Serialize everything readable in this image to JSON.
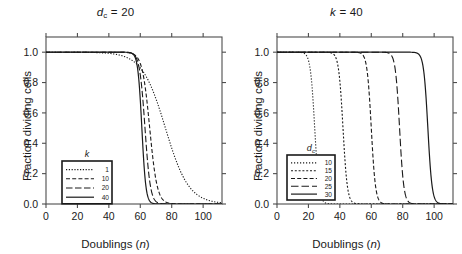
{
  "figure": {
    "background": "#ffffff",
    "line_color": "#1a1a1a",
    "axis_color": "#4d4d4d"
  },
  "chart_data": [
    {
      "type": "line",
      "panel_id": "left",
      "title": "d_c = 20",
      "title_parts": {
        "symbol": "d",
        "subscript": "c",
        "equals": "= 20"
      },
      "xlabel": "Doublings (n)",
      "xlabel_parts": {
        "text": "Doublings (",
        "italic": "n",
        "close": ")"
      },
      "ylabel": "Fraction dividing cells",
      "xlim": [
        0,
        112
      ],
      "ylim": [
        0,
        1.1
      ],
      "xticks": [
        0,
        20,
        40,
        60,
        80,
        100
      ],
      "xticklabels": [
        "0",
        "20",
        "40",
        "60",
        "80",
        "100"
      ],
      "yticks": [
        0.0,
        0.2,
        0.4,
        0.6,
        0.8,
        1.0
      ],
      "yticklabels": [
        "0.0",
        "0.2",
        "0.4",
        "0.6",
        "0.8",
        "1.0"
      ],
      "grid": false,
      "legend_position": "lower-left",
      "legend_title": "k",
      "legend_title_italic": true,
      "fixed_param": {
        "name": "d_c",
        "value": 20
      },
      "series": [
        {
          "name": "1",
          "param": "k",
          "value": 1,
          "dash": "1.2,1.6",
          "width": 1.1,
          "midpoint": 76,
          "steepness": 0.135
        },
        {
          "name": "10",
          "param": "k",
          "value": 10,
          "dash": "4,2.2",
          "width": 1.1,
          "midpoint": 66,
          "steepness": 0.42
        },
        {
          "name": "20",
          "param": "k",
          "value": 20,
          "dash": "6.5,2.5",
          "width": 1.1,
          "midpoint": 63,
          "steepness": 0.58
        },
        {
          "name": "40",
          "param": "k",
          "value": 40,
          "dash": "none",
          "width": 1.2,
          "midpoint": 61,
          "steepness": 0.78
        }
      ]
    },
    {
      "type": "line",
      "panel_id": "right",
      "title": "k = 40",
      "title_parts": {
        "symbol": "k",
        "subscript": "",
        "equals": "= 40"
      },
      "xlabel": "Doublings (n)",
      "xlabel_parts": {
        "text": "Doublings (",
        "italic": "n",
        "close": ")"
      },
      "ylabel": "Fraction dividing cells",
      "xlim": [
        0,
        112
      ],
      "ylim": [
        0,
        1.1
      ],
      "xticks": [
        0,
        20,
        40,
        60,
        80,
        100
      ],
      "xticklabels": [
        "0",
        "20",
        "40",
        "60",
        "80",
        "100"
      ],
      "yticks": [
        0.0,
        0.2,
        0.4,
        0.6,
        0.8,
        1.0
      ],
      "yticklabels": [
        "0.0",
        "0.2",
        "0.4",
        "0.6",
        "0.8",
        "1.0"
      ],
      "grid": false,
      "legend_position": "lower-left",
      "legend_title": "d_c",
      "legend_title_italic": true,
      "fixed_param": {
        "name": "k",
        "value": 40
      },
      "series": [
        {
          "name": "10",
          "param": "d_c",
          "value": 10,
          "dash": "1.2,1.8",
          "width": 1.1,
          "midpoint": 24,
          "steepness": 0.72
        },
        {
          "name": "15",
          "param": "d_c",
          "value": 15,
          "dash": "2,1.8",
          "width": 1.1,
          "midpoint": 42,
          "steepness": 0.72
        },
        {
          "name": "20",
          "param": "d_c",
          "value": 20,
          "dash": "4,2.2",
          "width": 1.1,
          "midpoint": 60,
          "steepness": 0.74
        },
        {
          "name": "25",
          "param": "d_c",
          "value": 25,
          "dash": "7.5,3",
          "width": 1.1,
          "midpoint": 78,
          "steepness": 0.74
        },
        {
          "name": "30",
          "param": "d_c",
          "value": 30,
          "dash": "none",
          "width": 1.2,
          "midpoint": 96,
          "steepness": 0.74
        }
      ]
    }
  ]
}
